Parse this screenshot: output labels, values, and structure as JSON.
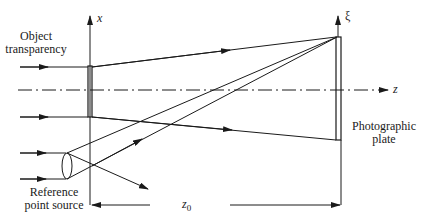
{
  "diagram": {
    "type": "holography-recording-setup",
    "labels": {
      "object": [
        "Object",
        "transparency"
      ],
      "reference": [
        "Reference",
        "point source"
      ],
      "plate": [
        "Photographic",
        "plate"
      ],
      "x_axis": "x",
      "xi_axis": "ξ",
      "z_axis": "z",
      "distance": "z",
      "distance_sub": "0"
    },
    "colors": {
      "line": "#1a1a1a",
      "background": "#ffffff"
    }
  }
}
